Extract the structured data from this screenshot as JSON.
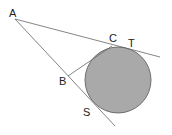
{
  "diagram": {
    "type": "geometry",
    "points": {
      "A": {
        "label": "A",
        "x": 15,
        "y": 19
      },
      "B": {
        "label": "B",
        "x": 68,
        "y": 76
      },
      "C": {
        "label": "C",
        "x": 112,
        "y": 46
      },
      "T": {
        "label": "T",
        "x": 128,
        "y": 48
      },
      "S": {
        "label": "S",
        "x": 96,
        "y": 106
      }
    },
    "circle": {
      "cx": 118,
      "cy": 80,
      "r": 33,
      "fill": "#a9a9a9",
      "stroke": "#555555"
    },
    "lines": [
      {
        "from": "A",
        "to_x": 160,
        "to_y": 57
      },
      {
        "from": "A",
        "to_x": 115,
        "to_y": 126
      },
      {
        "from": "B",
        "to": "C"
      }
    ],
    "colors": {
      "line": "#666666",
      "label": "#222222",
      "background": "#ffffff"
    }
  }
}
